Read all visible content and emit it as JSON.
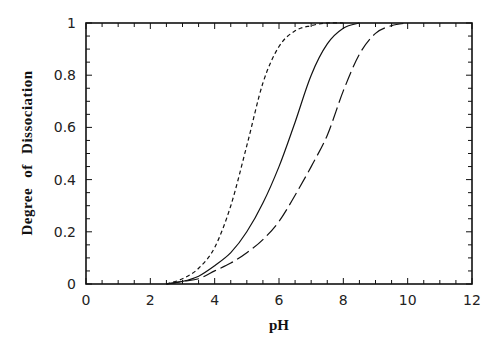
{
  "chart_data": {
    "type": "line",
    "title": "",
    "xlabel": "pH",
    "ylabel": "Degree of Dissociation",
    "xlim": [
      0,
      12
    ],
    "ylim": [
      0,
      1
    ],
    "xticks": [
      "0",
      "2",
      "4",
      "6",
      "8",
      "10",
      "12"
    ],
    "yticks": [
      "0",
      "0.2",
      "0.4",
      "0.6",
      "0.8",
      "1"
    ],
    "grid": false,
    "legend": null,
    "series": [
      {
        "name": "short-dashed curve",
        "style": "short-dash",
        "x": [
          2.5,
          3,
          3.5,
          4,
          4.5,
          5,
          5.5,
          6,
          6.5,
          7,
          7.5,
          8
        ],
        "values": [
          0,
          0.02,
          0.06,
          0.14,
          0.3,
          0.53,
          0.77,
          0.91,
          0.97,
          0.99,
          1.0,
          1.0
        ]
      },
      {
        "name": "solid curve",
        "style": "solid",
        "x": [
          2.5,
          3,
          3.5,
          4,
          4.5,
          5,
          5.5,
          6,
          6.5,
          7,
          7.5,
          8,
          8.5
        ],
        "values": [
          0,
          0.01,
          0.03,
          0.07,
          0.12,
          0.2,
          0.31,
          0.45,
          0.62,
          0.8,
          0.92,
          0.98,
          1.0
        ]
      },
      {
        "name": "long-dashed curve",
        "style": "long-dash",
        "x": [
          2.5,
          3,
          3.5,
          4,
          4.5,
          5,
          5.5,
          6,
          6.5,
          7,
          7.5,
          8,
          8.5,
          9,
          9.5,
          10
        ],
        "values": [
          0,
          0.01,
          0.02,
          0.05,
          0.08,
          0.12,
          0.17,
          0.24,
          0.34,
          0.45,
          0.57,
          0.74,
          0.88,
          0.96,
          0.99,
          1.0
        ]
      }
    ]
  }
}
